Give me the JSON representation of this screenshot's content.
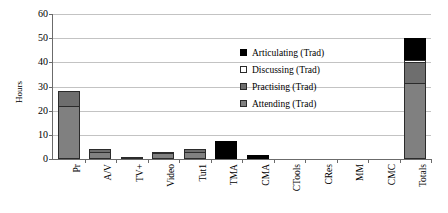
{
  "chart_data": {
    "type": "bar",
    "stacked": true,
    "title": "",
    "xlabel": "",
    "ylabel": "Hours",
    "ylim": [
      0,
      60
    ],
    "yticks": [
      0,
      10,
      20,
      30,
      40,
      50,
      60
    ],
    "grid": true,
    "legend_position": "inside-upper-right",
    "categories": [
      "Pr",
      "A/V",
      "TV+",
      "Video",
      "Tut1",
      "TMA",
      "CMA",
      "CTools",
      "CRes",
      "MM",
      "CMC",
      "Totals"
    ],
    "series": [
      {
        "name": "Attending (Trad)",
        "color": "#808080",
        "values": [
          22,
          3,
          1,
          2.5,
          3,
          0,
          0,
          0,
          0,
          0,
          0,
          31.5
        ]
      },
      {
        "name": "Practising (Trad)",
        "color": "#6e6e6e",
        "values": [
          6,
          1,
          0,
          0.5,
          1,
          0,
          0,
          0,
          0,
          0,
          0,
          8.5
        ]
      },
      {
        "name": "Discussing (Trad)",
        "color": "#ffffff",
        "values": [
          0,
          0,
          0,
          0,
          0,
          0,
          0,
          0,
          0,
          0,
          0,
          1
        ]
      },
      {
        "name": "Articulating (Trad)",
        "color": "#000000",
        "values": [
          0,
          0,
          0,
          0,
          0,
          7.5,
          1.5,
          0,
          0,
          0,
          0,
          9
        ]
      }
    ],
    "totals": [
      28,
      4,
      1,
      3,
      4,
      7.5,
      1.5,
      0,
      0,
      0,
      0,
      50
    ]
  },
  "legend": {
    "items": [
      {
        "label": "Articulating (Trad)",
        "swatch": "articulating"
      },
      {
        "label": "Discussing (Trad)",
        "swatch": "discussing"
      },
      {
        "label": "Practising (Trad)",
        "swatch": "practising"
      },
      {
        "label": "Attending (Trad)",
        "swatch": "attending"
      }
    ]
  }
}
